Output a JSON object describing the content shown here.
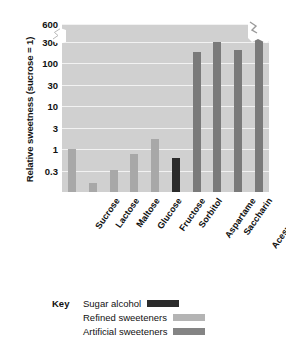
{
  "chart_data": {
    "type": "bar",
    "title": "",
    "xlabel": "",
    "ylabel": "Relative sweetness (sucrose = 1)",
    "yscale": "log",
    "ylim": [
      0.1,
      600
    ],
    "y_axis_break": true,
    "y_break_between": [
      300,
      600
    ],
    "grid": true,
    "yticks": [
      600,
      300,
      100,
      30,
      10,
      3,
      1,
      0.3
    ],
    "ytick_labels": [
      "600",
      "300",
      "100",
      "30",
      "10",
      "3",
      "1",
      "0.3"
    ],
    "categories": [
      "Sucrose",
      "Lactose",
      "Maltose",
      "Glucose",
      "Fructose",
      "Sorbitol",
      "Aspartame",
      "Saccharin",
      "Acesulfame K",
      "Sucralose"
    ],
    "values": [
      1,
      0.16,
      0.33,
      0.75,
      1.7,
      0.6,
      180,
      300,
      200,
      600
    ],
    "groups": [
      "refined",
      "refined",
      "refined",
      "refined",
      "refined",
      "alcohol",
      "artificial",
      "artificial",
      "artificial",
      "artificial"
    ],
    "legend_position": "bottom-left",
    "colors": {
      "alcohol": "#2b2b2b",
      "refined": "#a8a8a8",
      "artificial": "#7a7a7a",
      "plot_background": "#d0d0d0",
      "gridline": "#f2f2f2"
    }
  },
  "legend": {
    "title": "Key",
    "items": [
      {
        "label": "Sugar alcohol",
        "swatch": "alcohol"
      },
      {
        "label": "Refined sweeteners",
        "swatch": "refined"
      },
      {
        "label": "Artificial sweeteners",
        "swatch": "artificial"
      }
    ]
  }
}
